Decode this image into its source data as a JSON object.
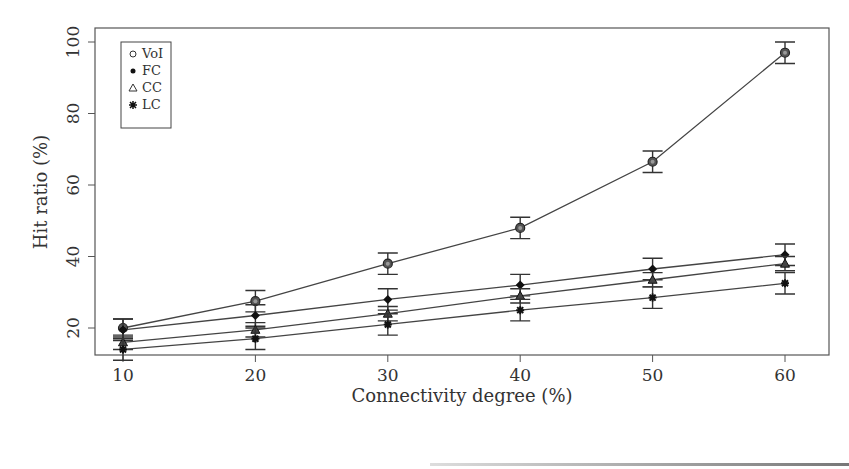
{
  "chart_data": {
    "type": "line",
    "title": "",
    "xlabel": "Connectivity degree (%)",
    "ylabel": "Hit ratio (%)",
    "x": [
      10,
      20,
      30,
      40,
      50,
      60
    ],
    "xticks": [
      "10",
      "20",
      "30",
      "40",
      "50",
      "60"
    ],
    "yticks": [
      "20",
      "40",
      "60",
      "80",
      "100"
    ],
    "xlim": [
      8.5,
      62
    ],
    "ylim": [
      8,
      104
    ],
    "grid": false,
    "legend_position": "top-left",
    "error_bars": true,
    "series": [
      {
        "name": "VoI",
        "marker": "circle-open",
        "values": [
          20,
          27.5,
          38,
          48,
          66.5,
          97
        ],
        "errors": [
          2.5,
          3,
          3,
          3,
          3,
          3
        ]
      },
      {
        "name": "FC",
        "marker": "diamond-filled",
        "values": [
          19.5,
          23.5,
          28,
          32,
          36.5,
          40.5
        ],
        "errors": [
          3,
          3,
          3,
          3,
          3,
          3
        ]
      },
      {
        "name": "CC",
        "marker": "triangle-open",
        "values": [
          16,
          19.5,
          24,
          29,
          33.5,
          38
        ],
        "errors": [
          2,
          2,
          2,
          2,
          2,
          2
        ]
      },
      {
        "name": "LC",
        "marker": "asterisk",
        "values": [
          14,
          17,
          21,
          25,
          28.5,
          32.5
        ],
        "errors": [
          3,
          3,
          3,
          3,
          3,
          3
        ]
      }
    ]
  }
}
